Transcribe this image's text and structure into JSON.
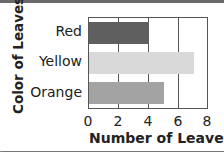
{
  "chart_data": {
    "type": "bar",
    "orientation": "horizontal",
    "title": "",
    "xlabel": "Number of Leaves",
    "ylabel": "Color of Leaves",
    "categories": [
      "Red",
      "Yellow",
      "Orange"
    ],
    "values": [
      4,
      7,
      5
    ],
    "xlim": [
      0,
      8
    ],
    "xticks": [
      "0",
      "2",
      "4",
      "6",
      "8"
    ],
    "grid": true,
    "legend": null,
    "bar_colors": [
      "#5f5f5f",
      "#d9d9d9",
      "#a3a3a3"
    ]
  }
}
